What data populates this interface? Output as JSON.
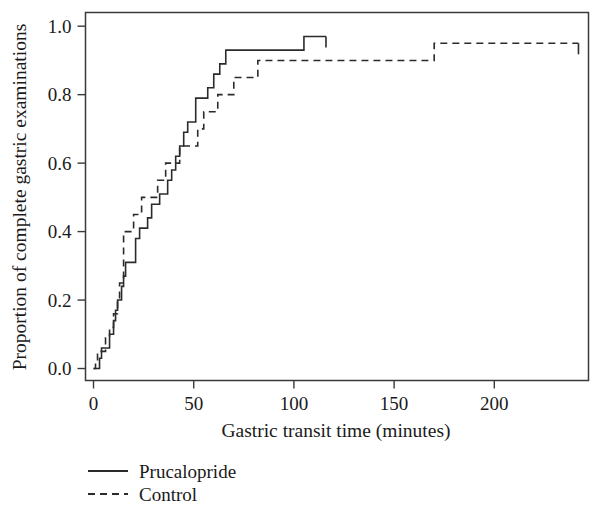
{
  "chart_data": {
    "type": "line",
    "subtype": "step-kaplan-meier-cumulative",
    "title": "",
    "xlabel": "Gastric transit time (minutes)",
    "ylabel": "Proportion of complete gastric examinations",
    "xlim": [
      -4,
      247
    ],
    "ylim": [
      -0.035,
      1.04
    ],
    "xticks": [
      0,
      50,
      100,
      150,
      200
    ],
    "xticklabels": [
      "0",
      "50",
      "100",
      "150",
      "200"
    ],
    "yticks": [
      0.0,
      0.2,
      0.4,
      0.6,
      0.8,
      1.0
    ],
    "yticklabels": [
      "0.0",
      "0.2",
      "0.4",
      "0.6",
      "0.8",
      "1.0"
    ],
    "grid": false,
    "legend_position": "below-left",
    "series": [
      {
        "name": "Prucalopride",
        "style": "solid",
        "x": [
          0,
          1,
          3,
          4,
          6,
          8,
          10,
          11,
          12,
          13,
          14,
          15,
          16,
          18,
          20,
          21,
          23,
          25,
          27,
          29,
          31,
          33,
          35,
          37,
          39,
          41,
          43,
          45,
          47,
          49,
          51,
          54,
          57,
          60,
          63,
          66,
          87,
          105,
          116
        ],
        "y": [
          0.0,
          0.0,
          0.03,
          0.06,
          0.06,
          0.1,
          0.14,
          0.17,
          0.2,
          0.2,
          0.24,
          0.27,
          0.31,
          0.31,
          0.31,
          0.38,
          0.41,
          0.41,
          0.44,
          0.48,
          0.48,
          0.51,
          0.51,
          0.55,
          0.58,
          0.62,
          0.65,
          0.69,
          0.72,
          0.72,
          0.79,
          0.79,
          0.82,
          0.86,
          0.89,
          0.93,
          0.93,
          0.97,
          0.97
        ],
        "end_tick": true
      },
      {
        "name": "Control",
        "style": "dashed",
        "x": [
          0,
          1,
          2,
          4,
          6,
          8,
          10,
          12,
          13,
          14,
          15,
          16,
          18,
          20,
          22,
          24,
          26,
          29,
          32,
          34,
          36,
          38,
          40,
          43,
          46,
          49,
          52,
          55,
          58,
          62,
          66,
          70,
          74,
          78,
          82,
          87,
          170,
          242
        ],
        "y": [
          0.0,
          0.02,
          0.05,
          0.05,
          0.09,
          0.12,
          0.16,
          0.2,
          0.25,
          0.25,
          0.4,
          0.4,
          0.4,
          0.45,
          0.45,
          0.5,
          0.5,
          0.5,
          0.55,
          0.55,
          0.6,
          0.6,
          0.6,
          0.65,
          0.65,
          0.65,
          0.7,
          0.75,
          0.75,
          0.8,
          0.8,
          0.85,
          0.85,
          0.85,
          0.9,
          0.9,
          0.95,
          0.95
        ],
        "end_tick": true
      }
    ]
  },
  "legend": {
    "entries": [
      {
        "label": "Prucalopride",
        "style": "solid"
      },
      {
        "label": "Control",
        "style": "dashed"
      }
    ]
  }
}
